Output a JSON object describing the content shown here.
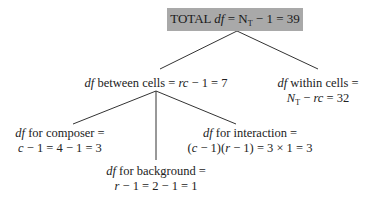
{
  "diagram": {
    "type": "tree",
    "root": {
      "label_prefix": "TOTAL ",
      "df": "df",
      "eq": " = N",
      "sub": "T",
      "rest": " − 1 = 39"
    },
    "between": {
      "df": "df",
      "label": " between cells = ",
      "formula_italic": "rc",
      "rest": " − 1 = 7"
    },
    "within": {
      "df": "df",
      "line1": " within cells =",
      "n": "N",
      "sub": "T",
      "line2_mid": " − ",
      "rc": "rc",
      "line2_rest": " = 32"
    },
    "composer": {
      "df": "df",
      "line1": " for composer =",
      "c": "c",
      "line2": " − 1 = 4 − 1 = 3"
    },
    "background": {
      "df": "df",
      "line1": " for background =",
      "r": "r",
      "line2": " − 1 = 2 − 1 = 1"
    },
    "interaction": {
      "df": "df",
      "line1": " for interaction =",
      "p1": "(",
      "c": "c",
      "p2": " − 1)(",
      "r": "r",
      "p3": " − 1) = 3 × 1 = 3"
    },
    "colors": {
      "box_fill": "#a9a9a9",
      "line": "#333333",
      "text": "#222222"
    }
  }
}
